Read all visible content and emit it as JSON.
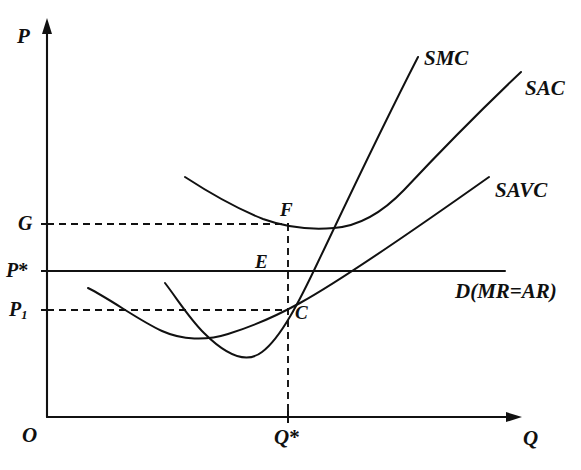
{
  "figure": {
    "background_color": "#ffffff",
    "ink_color": "#111111",
    "width": 581,
    "height": 470
  },
  "axes": {
    "y_axis_label": "P",
    "x_axis_label": "Q",
    "origin_label": "O",
    "x_axis_y_px": 417,
    "y_axis_x_px": 47,
    "x_axis_end_px": 520,
    "y_axis_top_px": 22
  },
  "price_levels": [
    {
      "id": "G",
      "label": "G",
      "y_px": 224,
      "line_style": "dashed",
      "is_subscripted": false
    },
    {
      "id": "Pstar",
      "label": "P",
      "suffix": "*",
      "y_px": 271,
      "line_style": "solid",
      "is_subscripted": false
    },
    {
      "id": "P1",
      "label": "P",
      "subscript": "1",
      "y_px": 310,
      "line_style": "dashed",
      "is_subscripted": true
    }
  ],
  "quantity_levels": [
    {
      "id": "Qstar",
      "label": "Q",
      "suffix": "*",
      "x_px": 288,
      "line_style": "dashed"
    }
  ],
  "curves": [
    {
      "id": "smc",
      "label": "SMC",
      "label_x_px": 424,
      "label_y_px": 48,
      "description": "Short-run marginal cost, U-shaped rising steeply",
      "path": "M 165,283 C 178,300 189,318 204,333 C 222,351 244,366 262,352 C 281,338 300,300 318,262 C 340,216 378,135 418,57"
    },
    {
      "id": "sac",
      "label": "SAC",
      "label_x_px": 525,
      "label_y_px": 78,
      "description": "Short-run average cost, U-shaped minimum near Q slightly right of Q*",
      "path": "M 185,177 C 208,192 238,209 263,219 C 285,227 310,230 334,228 C 360,226 382,213 404,190 C 434,158 482,109 521,72"
    },
    {
      "id": "savc",
      "label": "SAVC",
      "label_x_px": 495,
      "label_y_px": 180,
      "description": "Short-run average variable cost, U-shaped, minimum near left-centre, passes through C",
      "path": "M 88,288 C 112,300 138,320 162,331 C 182,340 206,341 228,334 C 254,326 278,315 300,303 C 340,281 424,223 489,177"
    }
  ],
  "demand": {
    "id": "demand",
    "label": "D(MR=AR)",
    "label_x_px": 455,
    "label_y_px": 281,
    "y_px": 271,
    "x_start_px": 47,
    "x_end_px": 505,
    "description": "Horizontal demand line equal to marginal revenue and average revenue"
  },
  "points": [
    {
      "id": "F",
      "label": "F",
      "x_px": 288,
      "y_px": 225,
      "label_x_px": 280,
      "label_y_px": 200,
      "description": "Intersection of SAC with the Q* vertical at price G"
    },
    {
      "id": "E",
      "label": "E",
      "x_px": 288,
      "y_px": 271,
      "label_x_px": 255,
      "label_y_px": 252,
      "description": "Equilibrium where SMC meets price line P*"
    },
    {
      "id": "C",
      "label": "C",
      "x_px": 288,
      "y_px": 310,
      "label_x_px": 295,
      "label_y_px": 303,
      "description": "Intersection of SAVC with the Q* vertical at price P1"
    }
  ],
  "guides": [
    {
      "id": "g-guide",
      "type": "horizontal-dashed",
      "from_x_px": 47,
      "to_x_px": 288,
      "y_px": 224
    },
    {
      "id": "p1-guide",
      "type": "horizontal-dashed",
      "from_x_px": 47,
      "to_x_px": 288,
      "y_px": 310
    },
    {
      "id": "qstar-guide",
      "type": "vertical-dashed",
      "x_px": 288,
      "from_y_px": 224,
      "to_y_px": 417
    }
  ]
}
